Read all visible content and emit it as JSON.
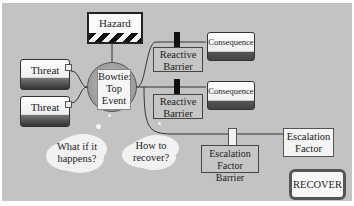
{
  "diagram": {
    "background_color": "#c3c3c3",
    "hazard": {
      "label": "Hazard"
    },
    "threats": [
      {
        "label": "Threat"
      },
      {
        "label": "Threat"
      }
    ],
    "top_event": {
      "line1": "Bowtie:",
      "line2": "Top",
      "line3": "Event"
    },
    "reactive_barriers": [
      {
        "line1": "Reactive",
        "line2": "Barrier"
      },
      {
        "line1": "Reactive",
        "line2": "Barrier"
      }
    ],
    "consequences": [
      {
        "label": "Consequence"
      },
      {
        "label": "Consequence"
      }
    ],
    "escalation_factor": {
      "line1": "Escalation",
      "line2": "Factor"
    },
    "escalation_factor_barrier": {
      "line1": "Escalation",
      "line2": "Factor Barrier"
    },
    "recover": {
      "label": "RECOVER"
    },
    "thought_clouds": [
      {
        "line1": "What if it",
        "line2": "happens?"
      },
      {
        "line1": "How to",
        "line2": "recover?"
      }
    ]
  }
}
